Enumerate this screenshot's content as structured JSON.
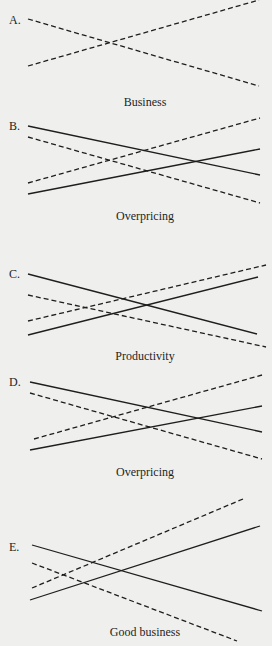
{
  "figure": {
    "panels": [
      {
        "label": "A.",
        "caption": "Business",
        "label_pos": [
          9,
          14
        ],
        "caption_y": 96,
        "center": [
          143,
          48
        ],
        "lines": [
          {
            "style": "dashed",
            "from": [
              28,
              19
            ],
            "to": [
              259,
              86
            ]
          },
          {
            "style": "dashed",
            "from": [
              28,
              66
            ],
            "to": [
              259,
              0
            ]
          }
        ]
      },
      {
        "label": "B.",
        "caption": "Overpricing",
        "label_pos": [
          9,
          120
        ],
        "caption_y": 210,
        "center": [
          147,
          166
        ],
        "lines": [
          {
            "style": "solid",
            "from": [
              28,
              126
            ],
            "to": [
              260,
              175
            ]
          },
          {
            "style": "dashed",
            "from": [
              28,
              137
            ],
            "to": [
              260,
              203
            ]
          },
          {
            "style": "dashed",
            "from": [
              28,
              183
            ],
            "to": [
              260,
              118
            ]
          },
          {
            "style": "solid",
            "from": [
              28,
              194
            ],
            "to": [
              260,
              149
            ]
          }
        ]
      },
      {
        "label": "C.",
        "caption": "Productivity",
        "label_pos": [
          9,
          268
        ],
        "caption_y": 350,
        "center": [
          145,
          305
        ],
        "lines": [
          {
            "style": "solid",
            "from": [
              28,
              274
            ],
            "to": [
              257,
              334
            ]
          },
          {
            "style": "dashed",
            "from": [
              28,
              295
            ],
            "to": [
              266,
              347
            ]
          },
          {
            "style": "dashed",
            "from": [
              28,
              321
            ],
            "to": [
              266,
              265
            ]
          },
          {
            "style": "solid",
            "from": [
              28,
              335
            ],
            "to": [
              258,
              277
            ]
          }
        ]
      },
      {
        "label": "D.",
        "caption": "Overpricing",
        "label_pos": [
          9,
          376
        ],
        "caption_y": 466,
        "center": [
          146,
          421
        ],
        "lines": [
          {
            "style": "solid",
            "from": [
              30,
              382
            ],
            "to": [
              262,
              432
            ]
          },
          {
            "style": "dashed",
            "from": [
              30,
              393
            ],
            "to": [
              262,
              459
            ]
          },
          {
            "style": "dashed",
            "from": [
              34,
              439
            ],
            "to": [
              262,
              375
            ]
          },
          {
            "style": "solid",
            "from": [
              30,
              450
            ],
            "to": [
              262,
              406
            ]
          }
        ]
      },
      {
        "label": "E.",
        "caption": "Good business",
        "label_pos": [
          9,
          541
        ],
        "caption_y": 626,
        "center": [
          145,
          572
        ],
        "lines": [
          {
            "style": "solid",
            "from": [
              32,
              545
            ],
            "to": [
              262,
              611
            ]
          },
          {
            "style": "dashed",
            "from": [
              32,
              563
            ],
            "to": [
              237,
              641
            ]
          },
          {
            "style": "dashed",
            "from": [
              32,
              588
            ],
            "to": [
              243,
              499
            ]
          },
          {
            "style": "solid",
            "from": [
              30,
              600
            ],
            "to": [
              260,
              526
            ]
          }
        ]
      }
    ]
  }
}
